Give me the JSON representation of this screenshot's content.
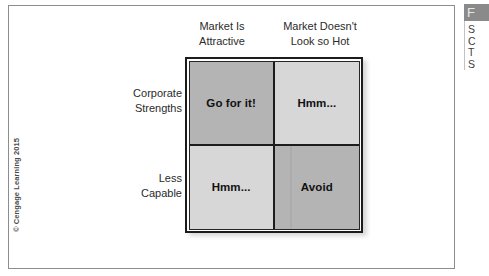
{
  "figure": {
    "copyright": "© Cengage Learning 2015",
    "column_headers": [
      {
        "line1": "Market Is",
        "line2": "Attractive"
      },
      {
        "line1": "Market Doesn't",
        "line2": "Look so Hot"
      }
    ],
    "row_labels": [
      {
        "line1": "Corporate",
        "line2": "Strengths"
      },
      {
        "line1": "Less",
        "line2": "Capable"
      }
    ],
    "quadrants": [
      {
        "label": "Go for it!",
        "shade": "dark",
        "row": "Corporate Strengths",
        "column": "Market Is Attractive"
      },
      {
        "label": "Hmm...",
        "shade": "light",
        "row": "Corporate Strengths",
        "column": "Market Doesn't Look so Hot"
      },
      {
        "label": "Hmm...",
        "shade": "light",
        "row": "Less Capable",
        "column": "Market Is Attractive"
      },
      {
        "label": "Avoid",
        "shade": "dark",
        "row": "Less Capable",
        "column": "Market Doesn't Look so Hot"
      }
    ],
    "colors": {
      "shade_dark": "#b4b4b4",
      "shade_light": "#d7d7d7",
      "matrix_border": "#1c1c1c",
      "page_border": "#8d8d8d",
      "text": "#2b2b2b"
    }
  },
  "side_panel": {
    "header_text": "F",
    "lines": [
      "S",
      "C",
      "T",
      "S"
    ]
  }
}
